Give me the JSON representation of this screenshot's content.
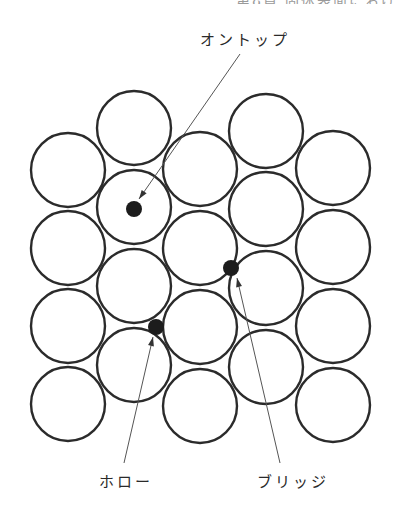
{
  "figure": {
    "clipped_header": "第8章 固体表面における",
    "labels": {
      "ontop": "オントップ",
      "hollow": "ホロー",
      "bridge": "ブリッジ"
    },
    "atom_radius": 37,
    "atoms": [
      {
        "col": "A",
        "cx": 68,
        "cy": 170
      },
      {
        "col": "A",
        "cx": 68,
        "cy": 248
      },
      {
        "col": "A",
        "cx": 68,
        "cy": 326
      },
      {
        "col": "A",
        "cx": 68,
        "cy": 404
      },
      {
        "col": "B",
        "cx": 134,
        "cy": 128
      },
      {
        "col": "B",
        "cx": 134,
        "cy": 207
      },
      {
        "col": "B",
        "cx": 134,
        "cy": 286
      },
      {
        "col": "B",
        "cx": 134,
        "cy": 365
      },
      {
        "col": "C",
        "cx": 200,
        "cy": 169
      },
      {
        "col": "C",
        "cx": 200,
        "cy": 248
      },
      {
        "col": "C",
        "cx": 200,
        "cy": 327
      },
      {
        "col": "C",
        "cx": 200,
        "cy": 406
      },
      {
        "col": "D",
        "cx": 266,
        "cy": 131
      },
      {
        "col": "D",
        "cx": 266,
        "cy": 209
      },
      {
        "col": "D",
        "cx": 266,
        "cy": 288
      },
      {
        "col": "D",
        "cx": 266,
        "cy": 367
      },
      {
        "col": "E",
        "cx": 333,
        "cy": 168
      },
      {
        "col": "E",
        "cx": 333,
        "cy": 247
      },
      {
        "col": "E",
        "cx": 333,
        "cy": 326
      },
      {
        "col": "E",
        "cx": 333,
        "cy": 405
      }
    ],
    "adsorption_sites": [
      {
        "name": "ontop",
        "cx": 134,
        "cy": 209,
        "r": 8
      },
      {
        "name": "bridge",
        "cx": 231,
        "cy": 268,
        "r": 8
      },
      {
        "name": "hollow",
        "cx": 156,
        "cy": 327,
        "r": 8
      }
    ],
    "arrows": [
      {
        "name": "ontop",
        "x1": 240,
        "y1": 54,
        "x2": 139,
        "y2": 199
      },
      {
        "name": "hollow",
        "x1": 124,
        "y1": 463,
        "x2": 153,
        "y2": 337
      },
      {
        "name": "bridge",
        "x1": 280,
        "y1": 463,
        "x2": 237,
        "y2": 278
      }
    ],
    "colors": {
      "atom_stroke": "#2b2b2b",
      "site_fill": "#1c1c1c",
      "arrow": "#555555",
      "text": "#2a2a2a"
    }
  }
}
